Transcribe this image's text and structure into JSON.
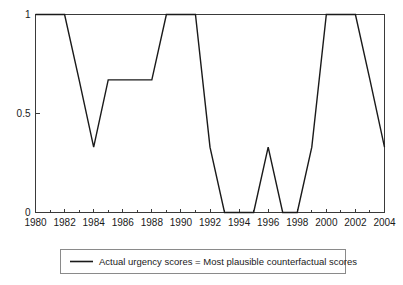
{
  "chart_data": {
    "type": "line",
    "title": "",
    "xlabel": "",
    "ylabel": "",
    "xlim": [
      1980,
      2004
    ],
    "ylim": [
      0,
      1
    ],
    "grid": false,
    "legend_position": "below-plot",
    "x_tick_labels": [
      "1980",
      "1982",
      "1984",
      "1986",
      "1988",
      "1990",
      "1992",
      "1994",
      "1996",
      "1998",
      "2000",
      "2002",
      "2004"
    ],
    "x_tick_values": [
      1980,
      1982,
      1984,
      1986,
      1988,
      1990,
      1992,
      1994,
      1996,
      1998,
      2000,
      2002,
      2004
    ],
    "x_minor_tick_values": [
      1981,
      1983,
      1985,
      1987,
      1989,
      1991,
      1993,
      1995,
      1997,
      1999,
      2001,
      2003
    ],
    "y_tick_labels": [
      "0",
      "0.5",
      "1"
    ],
    "y_tick_values": [
      0,
      0.5,
      1
    ],
    "x": [
      1980,
      1981,
      1982,
      1983,
      1984,
      1985,
      1986,
      1987,
      1988,
      1989,
      1990,
      1991,
      1992,
      1993,
      1994,
      1995,
      1996,
      1997,
      1998,
      1999,
      2000,
      2001,
      2002,
      2003,
      2004
    ],
    "series": [
      {
        "name": "Actual urgency scores = Most plausible counterfactual scores",
        "color": "#1a1a1a",
        "values": [
          1,
          1,
          1,
          0.67,
          0.33,
          0.67,
          0.67,
          0.67,
          0.67,
          1,
          1,
          1,
          0.33,
          0,
          0,
          0,
          0.33,
          0,
          0,
          0.33,
          1,
          1,
          1,
          0.67,
          0.33
        ]
      }
    ]
  },
  "legend": {
    "entries": [
      {
        "label": "Actual urgency scores = Most plausible counterfactual scores"
      }
    ]
  }
}
